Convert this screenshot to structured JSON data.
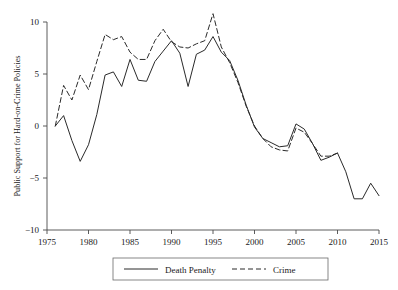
{
  "chart_data": {
    "type": "line",
    "title": "",
    "xlabel": "",
    "ylabel": "Public Support for Hard-on-Crime Policies",
    "xlim": [
      1975,
      2015
    ],
    "ylim": [
      -10,
      10
    ],
    "xticks": [
      1975,
      1980,
      1985,
      1990,
      1995,
      2000,
      2005,
      2010,
      2015
    ],
    "xtick_labels": [
      "1975",
      "1980",
      "1985",
      "1990",
      "1995",
      "2000",
      "2005",
      "2010",
      "2015"
    ],
    "yticks": [
      10,
      5,
      0,
      -5,
      -10
    ],
    "ytick_labels": [
      "10",
      "5",
      "0",
      "−5",
      "−10"
    ],
    "grid": false,
    "legend_position": "bottom",
    "series": [
      {
        "name": "Death Penalty",
        "style": "solid",
        "color": "#2a2a2a",
        "x": [
          1976,
          1977,
          1978,
          1979,
          1980,
          1981,
          1982,
          1983,
          1984,
          1985,
          1986,
          1987,
          1988,
          1989,
          1990,
          1991,
          1992,
          1993,
          1994,
          1995,
          1996,
          1997,
          1998,
          1999,
          2000,
          2001,
          2002,
          2003,
          2004,
          2005,
          2006,
          2007,
          2008,
          2009,
          2010,
          2011,
          2012,
          2013,
          2014,
          2015
        ],
        "y": [
          0.0,
          1.0,
          -1.4,
          -3.4,
          -1.8,
          1.1,
          4.9,
          5.2,
          3.8,
          6.4,
          4.4,
          4.3,
          6.2,
          7.2,
          8.2,
          7.0,
          3.8,
          6.9,
          7.3,
          8.6,
          7.1,
          6.3,
          4.4,
          2.0,
          -0.1,
          -1.2,
          -1.6,
          -2.0,
          -1.9,
          0.2,
          -0.3,
          -1.7,
          -3.3,
          -3.0,
          -2.6,
          -4.4,
          -7.0,
          -7.0,
          -5.5,
          -6.7
        ]
      },
      {
        "name": "Crime",
        "style": "dashed",
        "color": "#2a2a2a",
        "x": [
          1976,
          1977,
          1978,
          1979,
          1980,
          1981,
          1982,
          1983,
          1984,
          1985,
          1986,
          1987,
          1988,
          1989,
          1990,
          1991,
          1992,
          1993,
          1994,
          1995,
          1996,
          1997,
          1998,
          1999,
          2000,
          2001,
          2002,
          2003,
          2004,
          2005,
          2006,
          2007,
          2008,
          2009,
          2010
        ],
        "y": [
          0.0,
          3.9,
          2.5,
          4.9,
          3.5,
          6.2,
          8.8,
          8.3,
          8.6,
          7.1,
          6.4,
          6.4,
          8.2,
          9.3,
          8.1,
          7.6,
          7.5,
          7.9,
          8.2,
          10.8,
          7.6,
          6.1,
          4.2,
          1.9,
          0.0,
          -1.2,
          -2.0,
          -2.3,
          -2.4,
          -0.2,
          -0.6,
          -1.7,
          -2.9,
          -2.9,
          -2.6
        ]
      }
    ],
    "legend": [
      {
        "label": "Death Penalty",
        "style": "solid"
      },
      {
        "label": "Crime",
        "style": "dashed"
      }
    ]
  }
}
